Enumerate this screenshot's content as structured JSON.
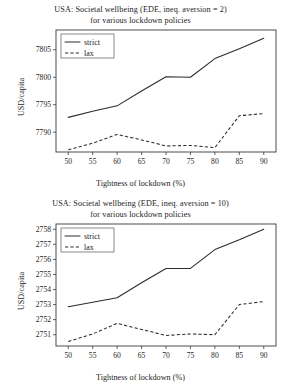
{
  "figure": {
    "ylabel": "USD/capita",
    "xlabel": "Tightness of lockdown (%)",
    "legend": {
      "strict": "strict",
      "lax": "lax"
    }
  },
  "chart_data": [
    {
      "type": "line",
      "title": "USA: Societal wellbeing (EDE, ineq. aversion = 2)",
      "subtitle": "for various lockdown policies",
      "xlabel": "Tightness of lockdown (%)",
      "ylabel": "USD/capita",
      "x": [
        50,
        55,
        60,
        65,
        70,
        75,
        80,
        85,
        90
      ],
      "xticks": [
        50,
        55,
        60,
        65,
        70,
        75,
        80,
        85,
        90
      ],
      "yticks": [
        7790,
        7795,
        7800,
        7805
      ],
      "xlim": [
        47.5,
        92.5
      ],
      "ylim": [
        7786.4,
        7808.6
      ],
      "grid": false,
      "legend_position": "upper left",
      "series": [
        {
          "name": "strict",
          "style": "solid",
          "values": [
            7792.7,
            7793.8,
            7794.8,
            7797.5,
            7800.1,
            7800.0,
            7803.4,
            7805.2,
            7807.1
          ]
        },
        {
          "name": "lax",
          "style": "dashed",
          "values": [
            7786.8,
            7788.0,
            7789.6,
            7788.6,
            7787.5,
            7787.6,
            7787.2,
            7793.0,
            7793.4
          ]
        }
      ]
    },
    {
      "type": "line",
      "title": "USA: Societal wellbeing (EDE, ineq. aversion = 10)",
      "subtitle": "for various lockdown policies",
      "xlabel": "Tightness of lockdown (%)",
      "ylabel": "USD/capita",
      "x": [
        50,
        55,
        60,
        65,
        70,
        75,
        80,
        85,
        90
      ],
      "xticks": [
        50,
        55,
        60,
        65,
        70,
        75,
        80,
        85,
        90
      ],
      "yticks": [
        2751,
        2752,
        2753,
        2754,
        2755,
        2756,
        2757,
        2758
      ],
      "xlim": [
        47.5,
        92.5
      ],
      "ylim": [
        2750.25,
        2758.35
      ],
      "grid": false,
      "legend_position": "upper left",
      "series": [
        {
          "name": "strict",
          "style": "solid",
          "values": [
            2752.85,
            2753.15,
            2753.45,
            2754.45,
            2755.4,
            2755.4,
            2756.65,
            2757.3,
            2758.0
          ]
        },
        {
          "name": "lax",
          "style": "dashed",
          "values": [
            2750.55,
            2751.05,
            2751.75,
            2751.35,
            2750.95,
            2751.05,
            2751.0,
            2753.0,
            2753.2
          ]
        }
      ]
    }
  ]
}
